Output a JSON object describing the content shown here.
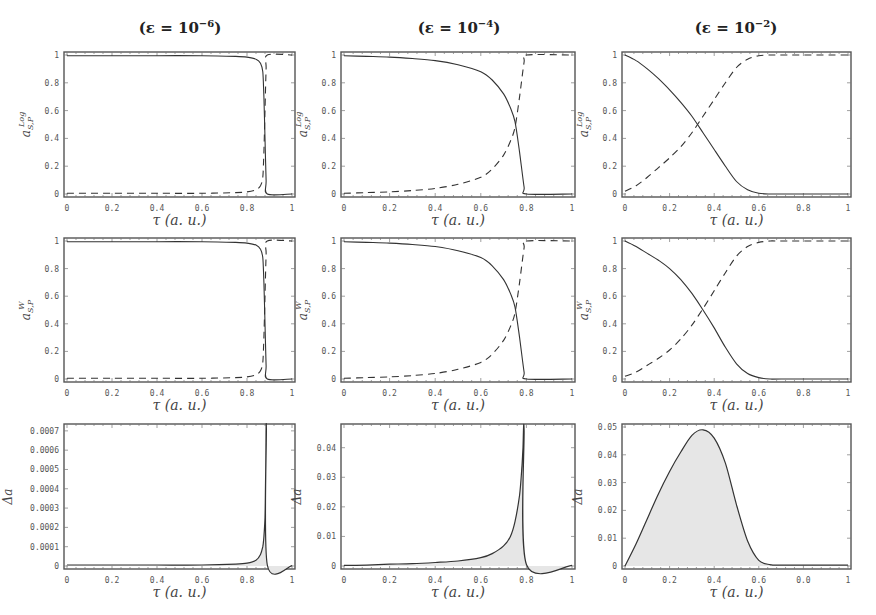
{
  "figure": {
    "columns": [
      {
        "title_prefix": "(ε = 10",
        "exponent": "−6",
        "title_suffix": ")"
      },
      {
        "title_prefix": "(ε = 10",
        "exponent": "−4",
        "title_suffix": ")"
      },
      {
        "title_prefix": "(ε = 10",
        "exponent": "−2",
        "title_suffix": ")"
      }
    ],
    "xlabel": "τ (a. u.)"
  },
  "chart_data": [
    {
      "type": "line",
      "row": 0,
      "col": 0,
      "title": "(ε = 10^-6)",
      "xlabel": "τ (a. u.)",
      "ylabel": "a^Log_{S,P}",
      "xlim": [
        0,
        1
      ],
      "ylim": [
        0,
        1
      ],
      "xticks": [
        "0",
        "0.2",
        "0.4",
        "0.6",
        "0.8",
        "1"
      ],
      "yticks": [
        "0",
        "0.2",
        "0.4",
        "0.6",
        "0.8",
        "1"
      ],
      "series": [
        {
          "name": "S (solid)",
          "style": "solid",
          "x": [
            0,
            0.2,
            0.4,
            0.6,
            0.75,
            0.8,
            0.84,
            0.86,
            0.87,
            0.875,
            0.88,
            0.885,
            0.89,
            1.0
          ],
          "y": [
            0.995,
            0.995,
            0.995,
            0.995,
            0.99,
            0.985,
            0.97,
            0.94,
            0.88,
            0.7,
            0.4,
            0.1,
            0.0,
            0.0
          ]
        },
        {
          "name": "P (dashed)",
          "style": "dashed",
          "x": [
            0,
            0.2,
            0.4,
            0.6,
            0.75,
            0.8,
            0.84,
            0.86,
            0.87,
            0.875,
            0.88,
            0.885,
            0.89,
            1.0
          ],
          "y": [
            0.005,
            0.005,
            0.005,
            0.005,
            0.01,
            0.015,
            0.03,
            0.06,
            0.12,
            0.3,
            0.6,
            0.9,
            1.0,
            1.0
          ]
        }
      ]
    },
    {
      "type": "line",
      "row": 0,
      "col": 1,
      "title": "(ε = 10^-4)",
      "xlabel": "τ (a. u.)",
      "ylabel": "a^Log_{S,P}",
      "xlim": [
        0,
        1
      ],
      "ylim": [
        0,
        1
      ],
      "xticks": [
        "0",
        "0.2",
        "0.4",
        "0.6",
        "0.8",
        "1"
      ],
      "yticks": [
        "0",
        "0.2",
        "0.4",
        "0.6",
        "0.8",
        "1"
      ],
      "series": [
        {
          "name": "S (solid)",
          "style": "solid",
          "x": [
            0,
            0.1,
            0.2,
            0.3,
            0.4,
            0.5,
            0.6,
            0.65,
            0.7,
            0.73,
            0.75,
            0.77,
            0.79,
            0.8,
            1.0
          ],
          "y": [
            0.995,
            0.99,
            0.985,
            0.975,
            0.96,
            0.93,
            0.88,
            0.82,
            0.72,
            0.62,
            0.52,
            0.3,
            0.05,
            0.0,
            0.0
          ]
        },
        {
          "name": "P (dashed)",
          "style": "dashed",
          "x": [
            0,
            0.1,
            0.2,
            0.3,
            0.4,
            0.5,
            0.6,
            0.65,
            0.7,
            0.73,
            0.75,
            0.77,
            0.79,
            0.8,
            1.0
          ],
          "y": [
            0.005,
            0.01,
            0.015,
            0.025,
            0.04,
            0.07,
            0.12,
            0.18,
            0.28,
            0.38,
            0.48,
            0.7,
            0.95,
            1.0,
            1.0
          ]
        }
      ]
    },
    {
      "type": "line",
      "row": 0,
      "col": 2,
      "title": "(ε = 10^-2)",
      "xlabel": "τ (a. u.)",
      "ylabel": "a^Log_{S,P}",
      "xlim": [
        0,
        1
      ],
      "ylim": [
        0,
        1
      ],
      "xticks": [
        "0",
        "0.2",
        "0.4",
        "0.6",
        "0.8",
        "1"
      ],
      "yticks": [
        "0",
        "0.2",
        "0.4",
        "0.6",
        "0.8",
        "1"
      ],
      "series": [
        {
          "name": "S (solid)",
          "style": "solid",
          "x": [
            0,
            0.05,
            0.1,
            0.15,
            0.2,
            0.25,
            0.3,
            0.35,
            0.4,
            0.45,
            0.5,
            0.55,
            0.6,
            0.65,
            0.7,
            1.0
          ],
          "y": [
            1.0,
            0.96,
            0.9,
            0.83,
            0.75,
            0.66,
            0.56,
            0.44,
            0.32,
            0.2,
            0.09,
            0.03,
            0.005,
            0.0,
            0.0,
            0.0
          ]
        },
        {
          "name": "P (dashed)",
          "style": "dashed",
          "x": [
            0,
            0.05,
            0.1,
            0.15,
            0.2,
            0.25,
            0.3,
            0.35,
            0.4,
            0.45,
            0.5,
            0.55,
            0.6,
            0.65,
            0.7,
            1.0
          ],
          "y": [
            0.02,
            0.06,
            0.12,
            0.19,
            0.26,
            0.34,
            0.44,
            0.56,
            0.68,
            0.8,
            0.91,
            0.97,
            0.995,
            1.0,
            1.0,
            1.0
          ]
        }
      ]
    },
    {
      "type": "line",
      "row": 1,
      "col": 0,
      "title": "",
      "xlabel": "τ (a. u.)",
      "ylabel": "a^W_{S,P}",
      "xlim": [
        0,
        1
      ],
      "ylim": [
        0,
        1
      ],
      "xticks": [
        "0",
        "0.2",
        "0.4",
        "0.6",
        "0.8",
        "1"
      ],
      "yticks": [
        "0",
        "0.2",
        "0.4",
        "0.6",
        "0.8",
        "1"
      ],
      "series": [
        {
          "name": "S (solid)",
          "style": "solid",
          "x": [
            0,
            0.2,
            0.4,
            0.6,
            0.75,
            0.8,
            0.84,
            0.86,
            0.87,
            0.875,
            0.88,
            0.885,
            0.89,
            1.0
          ],
          "y": [
            0.995,
            0.995,
            0.995,
            0.995,
            0.99,
            0.985,
            0.97,
            0.94,
            0.88,
            0.7,
            0.4,
            0.1,
            0.0,
            0.0
          ]
        },
        {
          "name": "P (dashed)",
          "style": "dashed",
          "x": [
            0,
            0.2,
            0.4,
            0.6,
            0.75,
            0.8,
            0.84,
            0.86,
            0.87,
            0.875,
            0.88,
            0.885,
            0.89,
            1.0
          ],
          "y": [
            0.005,
            0.005,
            0.005,
            0.005,
            0.01,
            0.015,
            0.03,
            0.06,
            0.12,
            0.3,
            0.6,
            0.9,
            1.0,
            1.0
          ]
        }
      ]
    },
    {
      "type": "line",
      "row": 1,
      "col": 1,
      "title": "",
      "xlabel": "τ (a. u.)",
      "ylabel": "a^W_{S,P}",
      "xlim": [
        0,
        1
      ],
      "ylim": [
        0,
        1
      ],
      "xticks": [
        "0",
        "0.2",
        "0.4",
        "0.6",
        "0.8",
        "1"
      ],
      "yticks": [
        "0",
        "0.2",
        "0.4",
        "0.6",
        "0.8",
        "1"
      ],
      "series": [
        {
          "name": "S (solid)",
          "style": "solid",
          "x": [
            0,
            0.1,
            0.2,
            0.3,
            0.4,
            0.5,
            0.6,
            0.65,
            0.7,
            0.73,
            0.75,
            0.77,
            0.79,
            0.8,
            1.0
          ],
          "y": [
            0.995,
            0.99,
            0.985,
            0.975,
            0.96,
            0.93,
            0.88,
            0.82,
            0.72,
            0.62,
            0.52,
            0.3,
            0.05,
            0.0,
            0.0
          ]
        },
        {
          "name": "P (dashed)",
          "style": "dashed",
          "x": [
            0,
            0.1,
            0.2,
            0.3,
            0.4,
            0.5,
            0.6,
            0.65,
            0.7,
            0.73,
            0.75,
            0.77,
            0.79,
            0.8,
            1.0
          ],
          "y": [
            0.005,
            0.01,
            0.015,
            0.025,
            0.04,
            0.07,
            0.12,
            0.18,
            0.28,
            0.38,
            0.48,
            0.7,
            0.95,
            1.0,
            1.0
          ]
        }
      ]
    },
    {
      "type": "line",
      "row": 1,
      "col": 2,
      "title": "",
      "xlabel": "τ (a. u.)",
      "ylabel": "a^W_{S,P}",
      "xlim": [
        0,
        1
      ],
      "ylim": [
        0,
        1
      ],
      "xticks": [
        "0",
        "0.2",
        "0.4",
        "0.6",
        "0.8",
        "1"
      ],
      "yticks": [
        "0",
        "0.2",
        "0.4",
        "0.6",
        "0.8",
        "1"
      ],
      "series": [
        {
          "name": "S (solid)",
          "style": "solid",
          "x": [
            0,
            0.05,
            0.1,
            0.15,
            0.2,
            0.25,
            0.3,
            0.35,
            0.4,
            0.45,
            0.5,
            0.55,
            0.6,
            0.65,
            0.7,
            1.0
          ],
          "y": [
            1.0,
            0.96,
            0.91,
            0.86,
            0.8,
            0.72,
            0.62,
            0.5,
            0.37,
            0.23,
            0.11,
            0.04,
            0.01,
            0.0,
            0.0,
            0.0
          ]
        },
        {
          "name": "P (dashed)",
          "style": "dashed",
          "x": [
            0,
            0.05,
            0.1,
            0.15,
            0.2,
            0.25,
            0.3,
            0.35,
            0.4,
            0.45,
            0.5,
            0.55,
            0.6,
            0.65,
            0.7,
            1.0
          ],
          "y": [
            0.02,
            0.05,
            0.1,
            0.15,
            0.21,
            0.29,
            0.39,
            0.51,
            0.64,
            0.77,
            0.89,
            0.96,
            0.99,
            1.0,
            1.0,
            1.0
          ]
        }
      ]
    },
    {
      "type": "area",
      "row": 2,
      "col": 0,
      "title": "",
      "xlabel": "τ (a. u.)",
      "ylabel": "Δa",
      "xlim": [
        0,
        1
      ],
      "ylim": [
        0,
        0.00072
      ],
      "xticks": [
        "0",
        "0.2",
        "0.4",
        "0.6",
        "0.8",
        "1"
      ],
      "yticks": [
        "0",
        "0.0001",
        "0.0002",
        "0.0003",
        "0.0004",
        "0.0005",
        "0.0006",
        "0.0007"
      ],
      "series": [
        {
          "name": "Δa",
          "style": "solid-filled",
          "x": [
            0,
            0.2,
            0.4,
            0.6,
            0.75,
            0.8,
            0.84,
            0.86,
            0.87,
            0.875,
            0.88,
            0.882,
            0.884,
            0.886,
            0.89,
            1.0
          ],
          "y": [
            5e-06,
            5e-06,
            5e-06,
            5e-06,
            1e-05,
            1.5e-05,
            3e-05,
            6e-05,
            0.0001,
            0.00015,
            0.00025,
            0.00038,
            0.0006,
            0.00071,
            5e-06,
            2e-06
          ]
        }
      ]
    },
    {
      "type": "area",
      "row": 2,
      "col": 1,
      "title": "",
      "xlabel": "τ (a. u.)",
      "ylabel": "Δa",
      "xlim": [
        0,
        1
      ],
      "ylim": [
        0,
        0.047
      ],
      "xticks": [
        "0",
        "0.2",
        "0.4",
        "0.6",
        "0.8",
        "1"
      ],
      "yticks": [
        "0",
        "0.01",
        "0.02",
        "0.03",
        "0.04"
      ],
      "series": [
        {
          "name": "Δa",
          "style": "solid-filled",
          "x": [
            0,
            0.1,
            0.2,
            0.3,
            0.4,
            0.5,
            0.6,
            0.65,
            0.7,
            0.73,
            0.75,
            0.77,
            0.78,
            0.785,
            0.79,
            0.8,
            1.0
          ],
          "y": [
            0.0002,
            0.0003,
            0.0006,
            0.0008,
            0.0012,
            0.0017,
            0.0028,
            0.0042,
            0.0068,
            0.01,
            0.015,
            0.024,
            0.033,
            0.04,
            0.046,
            0.0005,
            0.0002
          ]
        }
      ]
    },
    {
      "type": "area",
      "row": 2,
      "col": 2,
      "title": "",
      "xlabel": "τ (a. u.)",
      "ylabel": "Δa",
      "xlim": [
        0,
        1
      ],
      "ylim": [
        0,
        0.05
      ],
      "xticks": [
        "0",
        "0.2",
        "0.4",
        "0.6",
        "0.0",
        "1"
      ],
      "yticks": [
        "0",
        "0.01",
        "0.02",
        "0.03",
        "0.04",
        "0.05"
      ],
      "series": [
        {
          "name": "Δa",
          "style": "solid-filled",
          "x": [
            0,
            0.05,
            0.1,
            0.15,
            0.2,
            0.25,
            0.3,
            0.35,
            0.4,
            0.45,
            0.5,
            0.55,
            0.6,
            0.65,
            0.7,
            1.0
          ],
          "y": [
            0.0,
            0.008,
            0.017,
            0.026,
            0.034,
            0.041,
            0.047,
            0.049,
            0.046,
            0.037,
            0.022,
            0.009,
            0.002,
            0.0005,
            0.0003,
            0.0003
          ]
        }
      ]
    }
  ]
}
